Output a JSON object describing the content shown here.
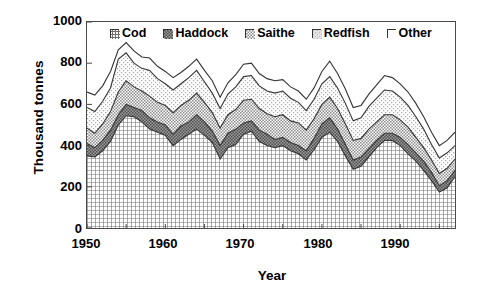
{
  "chart_data": {
    "type": "area",
    "stacked": true,
    "title": "",
    "xlabel": "Year",
    "ylabel": "Thousand tonnes",
    "xlim": [
      1950,
      1997
    ],
    "ylim": [
      0,
      1000
    ],
    "yticks": [
      0,
      200,
      400,
      600,
      800,
      1000
    ],
    "xticks": [
      1950,
      1960,
      1970,
      1980,
      1990
    ],
    "xtick_minor_step": 5,
    "grid": false,
    "legend_position": "top-inside-center",
    "x": [
      1950,
      1951,
      1952,
      1953,
      1954,
      1955,
      1956,
      1957,
      1958,
      1959,
      1960,
      1961,
      1962,
      1963,
      1964,
      1965,
      1966,
      1967,
      1968,
      1969,
      1970,
      1971,
      1972,
      1973,
      1974,
      1975,
      1976,
      1977,
      1978,
      1979,
      1980,
      1981,
      1982,
      1983,
      1984,
      1985,
      1986,
      1987,
      1988,
      1989,
      1990,
      1991,
      1992,
      1993,
      1994,
      1995,
      1996,
      1997
    ],
    "series": [
      {
        "name": "Cod",
        "pattern": "fine-grid-hatch",
        "color": "#b5b5b5",
        "values": [
          350,
          345,
          375,
          420,
          500,
          545,
          540,
          515,
          480,
          465,
          450,
          400,
          430,
          455,
          480,
          450,
          415,
          335,
          390,
          405,
          455,
          470,
          420,
          400,
          390,
          400,
          375,
          360,
          330,
          380,
          440,
          465,
          420,
          350,
          285,
          300,
          345,
          390,
          425,
          425,
          400,
          360,
          325,
          280,
          230,
          175,
          195,
          250
        ]
      },
      {
        "name": "Haddock",
        "pattern": "dense-dark-stipple",
        "color": "#888888",
        "values": [
          60,
          45,
          50,
          55,
          50,
          55,
          45,
          55,
          55,
          50,
          50,
          55,
          65,
          60,
          70,
          65,
          55,
          65,
          70,
          75,
          55,
          50,
          55,
          55,
          40,
          40,
          40,
          40,
          45,
          55,
          65,
          70,
          60,
          55,
          45,
          45,
          40,
          35,
          35,
          35,
          40,
          45,
          40,
          45,
          40,
          30,
          35,
          30
        ]
      },
      {
        "name": "Saithe",
        "pattern": "medium-stipple",
        "color": "#b9b9b9",
        "values": [
          75,
          70,
          80,
          90,
          110,
          115,
          100,
          95,
          105,
          95,
          95,
          105,
          100,
          105,
          105,
          95,
          90,
          85,
          90,
          95,
          110,
          105,
          105,
          100,
          110,
          110,
          105,
          110,
          100,
          95,
          95,
          100,
          100,
          100,
          95,
          90,
          95,
          90,
          90,
          90,
          85,
          85,
          75,
          65,
          60,
          60,
          60,
          55
        ]
      },
      {
        "name": "Redfish",
        "pattern": "light-stipple",
        "color": "#d8d8d8",
        "values": [
          100,
          105,
          110,
          115,
          160,
          135,
          115,
          110,
          125,
          115,
          105,
          110,
          105,
          110,
          110,
          100,
          95,
          95,
          100,
          110,
          115,
          115,
          110,
          110,
          115,
          115,
          110,
          100,
          95,
          95,
          100,
          100,
          100,
          100,
          95,
          100,
          110,
          115,
          120,
          115,
          110,
          105,
          100,
          90,
          75,
          75,
          75,
          65
        ]
      },
      {
        "name": "Other",
        "pattern": "white",
        "color": "#ffffff",
        "values": [
          75,
          80,
          75,
          80,
          45,
          50,
          60,
          55,
          60,
          60,
          60,
          60,
          55,
          55,
          55,
          55,
          60,
          55,
          55,
          60,
          60,
          60,
          60,
          60,
          60,
          55,
          55,
          55,
          55,
          55,
          60,
          75,
          70,
          70,
          65,
          60,
          60,
          65,
          70,
          65,
          65,
          65,
          65,
          60,
          60,
          60,
          60,
          65
        ]
      }
    ]
  },
  "legend": {
    "items": [
      {
        "label": "Cod",
        "swatch": "fine-grid-hatch-swatch"
      },
      {
        "label": "Haddock",
        "swatch": "dense-dark-stipple-swatch"
      },
      {
        "label": "Saithe",
        "swatch": "medium-stipple-swatch"
      },
      {
        "label": "Redfish",
        "swatch": "light-stipple-swatch"
      },
      {
        "label": "Other",
        "swatch": "white-swatch"
      }
    ]
  },
  "axes": {
    "y_title": "Thousand tonnes",
    "x_title": "Year",
    "y_labels": [
      "1000",
      "800",
      "600",
      "400",
      "200",
      "0"
    ],
    "x_labels": [
      "1950",
      "1960",
      "1970",
      "1980",
      "1990"
    ]
  },
  "style": {
    "line_color": "#333333",
    "frame_color": "#4a4a4a",
    "text_color": "#000000"
  }
}
